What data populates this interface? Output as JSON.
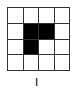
{
  "diagram": {
    "rows": 4,
    "cols": 4,
    "filled_color": "#000000",
    "empty_color": "#ffffff",
    "line_color": "#333333",
    "cells": [
      [
        0,
        0,
        0,
        0
      ],
      [
        0,
        1,
        1,
        0
      ],
      [
        0,
        1,
        0,
        0
      ],
      [
        0,
        0,
        0,
        0
      ]
    ],
    "label": "I"
  }
}
